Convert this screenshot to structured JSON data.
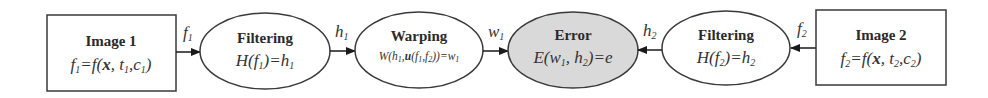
{
  "diagram": {
    "type": "flow",
    "colors": {
      "stroke": "#3a3a3a",
      "error_fill": "#d9d9d9",
      "node_fill": "#ffffff"
    },
    "nodes": [
      {
        "id": "image1",
        "shape": "rectangle",
        "title": "Image 1",
        "equation": "f1 = f(x, t1, c1)"
      },
      {
        "id": "filtering1",
        "shape": "ellipse",
        "title": "Filtering",
        "equation": "H(f1) = h1"
      },
      {
        "id": "warping",
        "shape": "ellipse",
        "title": "Warping",
        "equation": "W(h1, u(f1, f2)) = w1"
      },
      {
        "id": "error",
        "shape": "ellipse",
        "filled": true,
        "title": "Error",
        "equation": "E(w1, h2) = e"
      },
      {
        "id": "filtering2",
        "shape": "ellipse",
        "title": "Filtering",
        "equation": "H(f2) = h2"
      },
      {
        "id": "image2",
        "shape": "rectangle",
        "title": "Image 2",
        "equation": "f2 = f(x, t2, c2)"
      }
    ],
    "edges": [
      {
        "from": "image1",
        "to": "filtering1",
        "label": "f1"
      },
      {
        "from": "filtering1",
        "to": "warping",
        "label": "h1"
      },
      {
        "from": "warping",
        "to": "error",
        "label": "w1"
      },
      {
        "from": "filtering2",
        "to": "error",
        "label": "h2"
      },
      {
        "from": "image2",
        "to": "filtering2",
        "label": "f2"
      }
    ],
    "labels": {
      "image1_title": "Image 1",
      "filtering1_title": "Filtering",
      "warping_title": "Warping",
      "error_title": "Error",
      "filtering2_title": "Filtering",
      "image2_title": "Image 2",
      "f": "f",
      "x": "x",
      "t": "t",
      "c": "c",
      "H": "H",
      "h": "h",
      "W": "W",
      "u": "u",
      "w": "w",
      "E": "E",
      "e": "e",
      "sub1": "1",
      "sub2": "2"
    }
  }
}
